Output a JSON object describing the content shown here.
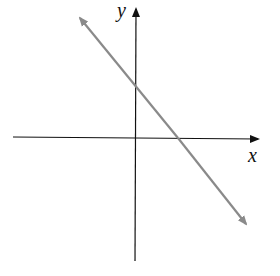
{
  "diagram": {
    "type": "coordinate-plane",
    "axes": {
      "x_label": "x",
      "y_label": "y",
      "color": "#111111"
    },
    "line": {
      "description": "straight line with negative slope, arrows at both ends",
      "color": "#8a8a8a",
      "y_intercept": "positive",
      "x_intercept": "positive"
    }
  }
}
